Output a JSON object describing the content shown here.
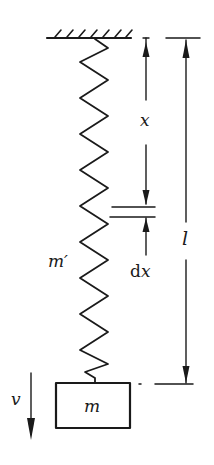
{
  "figure": {
    "title": "",
    "colors": {
      "ink": "#1a1a1a",
      "background": "#ffffff"
    }
  },
  "labels": {
    "x": "x",
    "dx_d": "d",
    "dx_x": "x",
    "l": "l",
    "spring_mass": "m′",
    "mass": "m",
    "velocity": "v"
  },
  "elements": {
    "ceiling": {
      "type": "fixed-support-hatched"
    },
    "spring": {
      "type": "zigzag-spring",
      "coils": 17
    },
    "block": {
      "type": "rectangle-mass"
    },
    "dim_x": {
      "type": "dimension-arrow",
      "from": "ceiling",
      "to": "element-dx"
    },
    "dim_dx": {
      "type": "element-marker"
    },
    "dim_l": {
      "type": "dimension-arrow",
      "from": "ceiling",
      "to": "block-top"
    },
    "velocity_arrow": {
      "type": "arrow-down"
    }
  }
}
